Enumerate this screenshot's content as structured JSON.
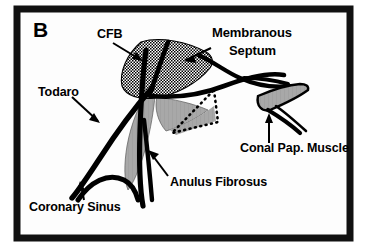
{
  "figure": {
    "panel_letter": "B",
    "background_color": "#ffffff",
    "frame_color": "#111111",
    "ink_color": "#000000",
    "shade_gray": "#9c9c9c",
    "shade_gray_light": "#b4b4b4"
  },
  "labels": {
    "cfb": "CFB",
    "membranous": "Membranous",
    "septum": "Septum",
    "todaro": "Todaro",
    "conal_pap_muscle": "Conal  Pap. Muscle",
    "anulus_fibrosus": "Anulus Fibrosus",
    "coronary_sinus": "Coronary Sinus"
  },
  "structures": [
    {
      "name": "central-fibrous-body",
      "fill": "stipple-crosshatch",
      "label_key": "cfb"
    },
    {
      "name": "membranous-septum",
      "fill": "stipple-crosshatch",
      "label_key": "membranous"
    },
    {
      "name": "tendon-of-todaro",
      "fill": "solid-black-stroke",
      "label_key": "todaro"
    },
    {
      "name": "anulus-fibrosus",
      "fill": "solid-black-stroke",
      "label_key": "anulus_fibrosus"
    },
    {
      "name": "conal-papillary-muscle",
      "fill": "gray",
      "label_key": "conal_pap_muscle"
    },
    {
      "name": "coronary-sinus",
      "fill": "solid-black-stroke",
      "label_key": "coronary_sinus"
    },
    {
      "name": "tricuspid-leaflet-gray",
      "fill": "gray",
      "label_key": null
    },
    {
      "name": "dotted-triangle-region",
      "fill": "gray-dotted-outline",
      "label_key": null
    }
  ]
}
